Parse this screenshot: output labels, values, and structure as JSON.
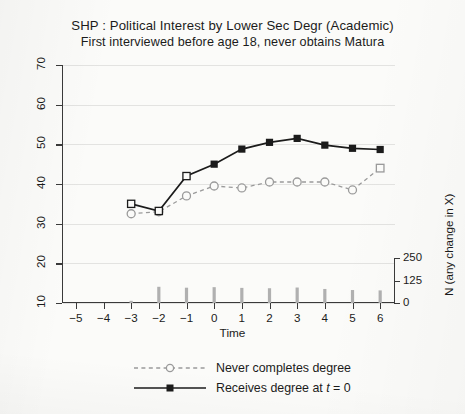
{
  "title": {
    "line1": "SHP : Political Interest by Lower Sec Degr (Academic)",
    "line2": "First interviewed before age 18, never obtains Matura"
  },
  "legend": {
    "items": [
      {
        "label_plain": "Never completes degree",
        "marker": "open-circle",
        "line": "dashed",
        "color": "#9a9a9a"
      },
      {
        "label_plain": "Receives degree at t = 0",
        "marker": "filled-square",
        "line": "solid",
        "color": "#1b1b1b"
      }
    ]
  },
  "axes": {
    "x_title": "Time",
    "y_right_title": "N (any change in X)",
    "y_left_ticks": [
      "10",
      "20",
      "30",
      "40",
      "50",
      "60",
      "70"
    ],
    "y_right_ticks": [
      "0",
      "125",
      "250"
    ],
    "x_ticks": [
      "-5",
      "-4",
      "-3",
      "-2",
      "-1",
      "0",
      "1",
      "2",
      "3",
      "4",
      "5",
      "6"
    ]
  },
  "chart_data": {
    "type": "line",
    "title": "SHP : Political Interest by Lower Sec Degr (Academic)",
    "subtitle": "First interviewed before age 18, never obtains Matura",
    "xlabel": "Time",
    "ylabel": "",
    "y2label": "N (any change in X)",
    "xlim": [
      -5.5,
      6.5
    ],
    "ylim": [
      10,
      70
    ],
    "y2lim": [
      0,
      250
    ],
    "grid": true,
    "legend_position": "below",
    "x": [
      -5,
      -4,
      -3,
      -2,
      -1,
      0,
      1,
      2,
      3,
      4,
      5,
      6
    ],
    "series": [
      {
        "name": "Never completes degree",
        "style": "dashed",
        "marker": "open-circle",
        "color": "#9a9a9a",
        "x": [
          -3,
          -2,
          -1,
          0,
          1,
          2,
          3,
          4,
          5,
          6
        ],
        "values": [
          32.5,
          33.0,
          37.0,
          39.5,
          39.0,
          40.5,
          40.5,
          40.5,
          38.5,
          44.0
        ]
      },
      {
        "name": "Receives degree at t = 0",
        "style": "solid",
        "marker": "filled-square",
        "color": "#1b1b1b",
        "x": [
          -3,
          -2,
          -1,
          0,
          1,
          2,
          3,
          4,
          5,
          6
        ],
        "values": [
          35.0,
          33.2,
          42.0,
          45.0,
          48.8,
          50.5,
          51.5,
          49.8,
          49.0,
          48.7
        ],
        "marker_overrides": {
          "-3": "open-square",
          "-2": "open-square",
          "-1": "open-square"
        }
      },
      {
        "name": "N (any change in X)",
        "style": "bars",
        "axis": "right",
        "color": "#b0b0b0",
        "x": [
          -3,
          -2,
          -1,
          0,
          1,
          2,
          3,
          4,
          5,
          6
        ],
        "values": [
          12,
          90,
          85,
          88,
          84,
          82,
          86,
          78,
          72,
          70
        ]
      }
    ]
  }
}
